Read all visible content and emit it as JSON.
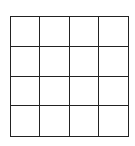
{
  "grid": {
    "rows": 4,
    "columns": 4,
    "line_color": "#222222",
    "cell_color": "#ffffff",
    "cells": [
      [
        "",
        "",
        "",
        ""
      ],
      [
        "",
        "",
        "",
        ""
      ],
      [
        "",
        "",
        "",
        ""
      ],
      [
        "",
        "",
        "",
        ""
      ]
    ]
  }
}
